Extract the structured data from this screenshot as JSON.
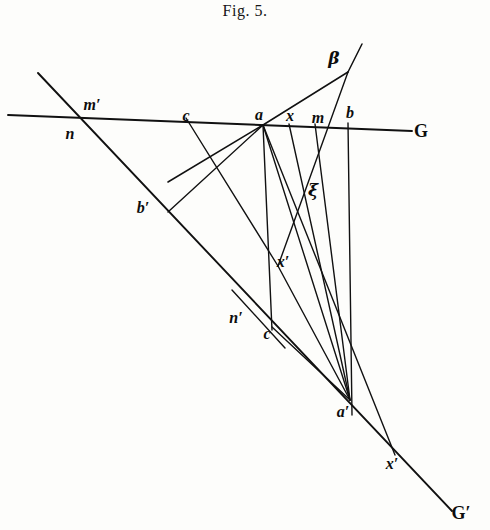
{
  "figure": {
    "caption": "Fig. 5.",
    "type": "projective-geometry-line-diagram",
    "ink_color": "#111111",
    "paper_color": "#fdfdfb"
  },
  "chart_data": {
    "type": "diagram",
    "title": "Fig. 5.",
    "xlabel": "",
    "ylabel": "",
    "grid": false,
    "legend": null,
    "points": [
      {
        "name": "beta",
        "label": "β",
        "x": 348,
        "y": 72,
        "label_x": 334,
        "label_y": 58,
        "on": [
          "projection-centre"
        ]
      },
      {
        "name": "n",
        "label": "n",
        "x": 75,
        "y": 120,
        "label_x": 70,
        "label_y": 134,
        "on": [
          "G"
        ]
      },
      {
        "name": "m-prime",
        "label": "m′",
        "x": 84,
        "y": 114,
        "label_x": 92,
        "label_y": 105,
        "on": [
          "G"
        ]
      },
      {
        "name": "c",
        "label": "c",
        "x": 186,
        "y": 118,
        "label_x": 186,
        "label_y": 116,
        "on": [
          "G"
        ]
      },
      {
        "name": "a",
        "label": "a",
        "x": 263,
        "y": 125,
        "label_x": 259,
        "label_y": 115,
        "on": [
          "G"
        ]
      },
      {
        "name": "x",
        "label": "x",
        "x": 289,
        "y": 124,
        "label_x": 290,
        "label_y": 116,
        "on": [
          "G"
        ]
      },
      {
        "name": "m",
        "label": "m",
        "x": 315,
        "y": 124,
        "label_x": 318,
        "label_y": 118,
        "on": [
          "G"
        ]
      },
      {
        "name": "b",
        "label": "b",
        "x": 348,
        "y": 123,
        "label_x": 350,
        "label_y": 113,
        "on": [
          "G"
        ]
      },
      {
        "name": "G-end",
        "label": "G",
        "x": 408,
        "y": 130,
        "label_x": 421,
        "label_y": 131,
        "on": [
          "G"
        ]
      },
      {
        "name": "b-prime",
        "label": "b′",
        "x": 168,
        "y": 212,
        "label_x": 143,
        "label_y": 208,
        "on": [
          "G-prime"
        ]
      },
      {
        "name": "xi",
        "label": "ξ",
        "x": 300,
        "y": 195,
        "label_x": 313,
        "label_y": 190,
        "on": [
          "ray-intersection"
        ]
      },
      {
        "name": "x-prime-upper",
        "label": "x′",
        "x": 278,
        "y": 266,
        "label_x": 283,
        "label_y": 262,
        "on": [
          "ray-intersection"
        ]
      },
      {
        "name": "n-prime",
        "label": "n′",
        "x": 251,
        "y": 310,
        "label_x": 236,
        "label_y": 318,
        "on": [
          "G-prime"
        ]
      },
      {
        "name": "c-prime",
        "label": "c",
        "x": 272,
        "y": 325,
        "label_x": 267,
        "label_y": 334,
        "on": [
          "G-prime"
        ]
      },
      {
        "name": "a-prime",
        "label": "a′",
        "x": 350,
        "y": 400,
        "label_x": 343,
        "label_y": 412,
        "on": [
          "G-prime"
        ]
      },
      {
        "name": "x-prime-lower",
        "label": "x′",
        "x": 395,
        "y": 455,
        "label_x": 392,
        "label_y": 464,
        "on": [
          "G-prime"
        ]
      },
      {
        "name": "G-prime-end",
        "label": "G′",
        "x": 450,
        "y": 508,
        "label_x": 461,
        "label_y": 513,
        "on": [
          "G-prime"
        ]
      }
    ],
    "lines": [
      {
        "name": "line-G",
        "from": [
          8,
          115
        ],
        "to": [
          412,
          131
        ],
        "width": 1.9,
        "note": "principal transversal G"
      },
      {
        "name": "line-G-prime",
        "from": [
          38,
          73
        ],
        "to": [
          452,
          511
        ],
        "width": 1.9,
        "note": "oblique transversal G' through n, b', n', a', x'"
      },
      {
        "name": "ray-beta-a",
        "from": [
          348,
          72
        ],
        "to": [
          263,
          125
        ],
        "width": 1.5
      },
      {
        "name": "ray-beta-a-ext",
        "from": [
          263,
          125
        ],
        "to": [
          168,
          182
        ],
        "width": 1.5
      },
      {
        "name": "ray-beta-xi",
        "from": [
          348,
          72
        ],
        "to": [
          278,
          266
        ],
        "width": 1.4
      },
      {
        "name": "ray-beta-top-ext",
        "from": [
          348,
          72
        ],
        "to": [
          362,
          44
        ],
        "width": 1.5
      },
      {
        "name": "vertical-a-aprime",
        "from": [
          263,
          125
        ],
        "to": [
          350,
          400
        ],
        "width": 1.4
      },
      {
        "name": "vertical-b-down",
        "from": [
          348,
          123
        ],
        "to": [
          352,
          415
        ],
        "width": 1.4
      },
      {
        "name": "line-c-bprime",
        "from": [
          186,
          118
        ],
        "to": [
          278,
          266
        ],
        "width": 1.4
      },
      {
        "name": "line-a-bprime",
        "from": [
          263,
          125
        ],
        "to": [
          168,
          212
        ],
        "width": 1.4
      },
      {
        "name": "line-a-cprime",
        "from": [
          263,
          125
        ],
        "to": [
          272,
          330
        ],
        "width": 1.4
      },
      {
        "name": "line-a-xlow",
        "from": [
          263,
          125
        ],
        "to": [
          395,
          455
        ],
        "width": 1.4
      },
      {
        "name": "line-x-aprime",
        "from": [
          289,
          124
        ],
        "to": [
          350,
          400
        ],
        "width": 1.4
      },
      {
        "name": "line-m-aprime",
        "from": [
          315,
          124
        ],
        "to": [
          350,
          400
        ],
        "width": 1.4
      },
      {
        "name": "line-cprime-aprime",
        "from": [
          272,
          327
        ],
        "to": [
          350,
          400
        ],
        "width": 1.4
      },
      {
        "name": "line-xprime-aprime",
        "from": [
          278,
          266
        ],
        "to": [
          350,
          400
        ],
        "width": 1.4
      },
      {
        "name": "line-nprime-cross",
        "from": [
          232,
          290
        ],
        "to": [
          285,
          348
        ],
        "width": 1.4
      }
    ]
  },
  "labels": [
    {
      "key": "beta",
      "text": "β"
    },
    {
      "key": "n",
      "text": "n"
    },
    {
      "key": "m_prime",
      "text": "m′"
    },
    {
      "key": "c",
      "text": "c"
    },
    {
      "key": "a",
      "text": "a"
    },
    {
      "key": "x",
      "text": "x"
    },
    {
      "key": "m",
      "text": "m"
    },
    {
      "key": "b",
      "text": "b"
    },
    {
      "key": "G",
      "text": "G"
    },
    {
      "key": "b_prime",
      "text": "b′"
    },
    {
      "key": "xi",
      "text": "ξ"
    },
    {
      "key": "x_prime_upper",
      "text": "x′"
    },
    {
      "key": "n_prime",
      "text": "n′"
    },
    {
      "key": "c_prime",
      "text": "c"
    },
    {
      "key": "a_prime",
      "text": "a′"
    },
    {
      "key": "x_prime_lower",
      "text": "x′"
    },
    {
      "key": "G_prime",
      "text": "G′"
    }
  ]
}
